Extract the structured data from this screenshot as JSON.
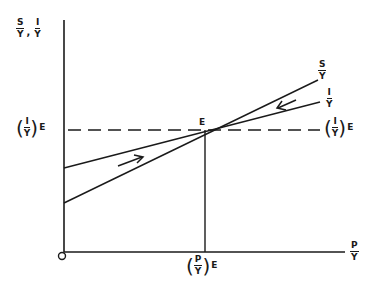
{
  "diagram": {
    "y_axis_label": {
      "left_num": "S",
      "left_den": "Y",
      "sep": ",",
      "right_num": "I",
      "right_den": "Y"
    },
    "x_axis_label": {
      "num": "P",
      "den": "Y"
    },
    "origin_label": "O",
    "equilibrium_point": "E",
    "y_equilibrium_label_left": {
      "num": "I",
      "den": "Y",
      "sub": "E"
    },
    "y_equilibrium_label_right": {
      "num": "I",
      "den": "Y",
      "sub": "E"
    },
    "x_equilibrium_label": {
      "num": "P",
      "den": "Y",
      "sub": "E"
    },
    "savings_curve_label": {
      "num": "S",
      "den": "Y"
    },
    "investment_curve_label": {
      "num": "I",
      "den": "Y"
    },
    "arrows": [
      {
        "name": "lower-left-arrow",
        "direction": "right-toward-E"
      },
      {
        "name": "upper-right-arrow",
        "direction": "left-toward-E"
      }
    ],
    "colors": {
      "ink": "#1a1a1a",
      "background": "#ffffff"
    }
  }
}
